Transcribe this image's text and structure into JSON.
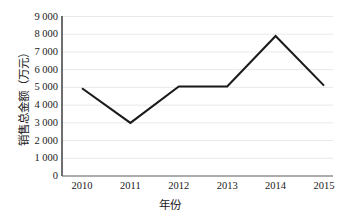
{
  "chart_data": {
    "type": "line",
    "title": "",
    "xlabel": "年份",
    "ylabel": "销售总金额（万元）",
    "categories": [
      "2010",
      "2011",
      "2012",
      "2013",
      "2014",
      "2015"
    ],
    "values": [
      4950,
      3000,
      5050,
      5050,
      7900,
      5100
    ],
    "series": [
      {
        "name": "销售总金额",
        "values": [
          4950,
          3000,
          5050,
          5050,
          7900,
          5100
        ]
      }
    ],
    "ylim": [
      0,
      9000
    ],
    "y_ticks": [
      0,
      1000,
      2000,
      3000,
      4000,
      5000,
      6000,
      7000,
      8000,
      9000
    ],
    "y_tick_labels": [
      "0",
      "1 000",
      "2 000",
      "3 000",
      "4 000",
      "5 000",
      "6 000",
      "7 000",
      "8 000",
      "9 000"
    ],
    "x_tick_labels": [
      "2010",
      "2011",
      "2012",
      "2013",
      "2014",
      "2015"
    ],
    "grid": true,
    "grid_orientation": "horizontal",
    "legend": false,
    "legend_position": "none",
    "line_color": "#1a1a1a",
    "grid_color": "#e9e9e9",
    "axis_color": "#4a4a4a",
    "background_color": "#ffffff"
  }
}
